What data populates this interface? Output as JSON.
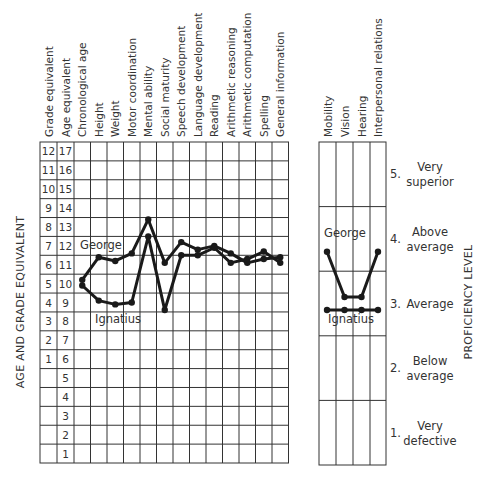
{
  "chart_data": [
    {
      "type": "line",
      "title": "",
      "ylabel": "AGE AND GRADE EQUIVALENT",
      "categories": [
        "Chronological age",
        "Height",
        "Weight",
        "Motor coordination",
        "Mental ability",
        "Social maturity",
        "Speech development",
        "Language development",
        "Reading",
        "Arithmetic reasoning",
        "Arithmetic computation",
        "Spelling",
        "General information"
      ],
      "y_scales": {
        "grade_equivalent": [
          "12",
          "11",
          "10",
          "9",
          "8",
          "7",
          "6",
          "5",
          "4",
          "3",
          "2",
          "1",
          "",
          "",
          "",
          "",
          ""
        ],
        "age_equivalent": [
          "17",
          "16",
          "15",
          "14",
          "13",
          "12",
          "11",
          "10",
          "9",
          "8",
          "7",
          "6",
          "5",
          "4",
          "3",
          "2",
          "1"
        ]
      },
      "ylim_age": [
        0,
        17
      ],
      "series": [
        {
          "name": "George",
          "values": [
            10.2,
            11.4,
            11.2,
            11.6,
            13.4,
            11.1,
            12.2,
            11.8,
            12.0,
            11.6,
            11.1,
            11.3,
            11.4
          ]
        },
        {
          "name": "Ignatius",
          "values": [
            9.9,
            9.1,
            8.9,
            9.0,
            12.5,
            8.6,
            11.5,
            11.5,
            11.9,
            11.1,
            11.3,
            11.7,
            11.1
          ]
        }
      ],
      "annotations": [
        "George",
        "Ignatius"
      ],
      "grid": true
    },
    {
      "type": "line",
      "title": "",
      "ylabel": "PROFICIENCY LEVEL",
      "categories": [
        "Mobility",
        "Vision",
        "Hearing",
        "Interpersonal relations"
      ],
      "levels": [
        {
          "num": "5.",
          "line1": "Very",
          "line2": "superior"
        },
        {
          "num": "4.",
          "line1": "Above",
          "line2": "average"
        },
        {
          "num": "3.",
          "line1": "Average",
          "line2": ""
        },
        {
          "num": "2.",
          "line1": "Below",
          "line2": "average"
        },
        {
          "num": "1.",
          "line1": "Very",
          "line2": "defective"
        }
      ],
      "ylim": [
        0.5,
        5.5
      ],
      "series": [
        {
          "name": "George",
          "values": [
            3.8,
            3.1,
            3.1,
            3.8
          ]
        },
        {
          "name": "Ignatius",
          "values": [
            2.9,
            2.9,
            2.9,
            2.9
          ]
        }
      ],
      "annotations": [
        "George",
        "Ignatius"
      ],
      "grid": true
    }
  ],
  "left": {
    "headers": [
      "Grade equivalent",
      "Age equivalent",
      "Chronological age",
      "Height",
      "Weight",
      "Motor coordination",
      "Mental ability",
      "Social maturity",
      "Speech development",
      "Language development",
      "Reading",
      "Arithmetic reasoning",
      "Arithmetic computation",
      "Spelling",
      "General information"
    ],
    "axis_label": "AGE AND GRADE EQUIVALENT",
    "george_label": "George",
    "ignatius_label": "Ignatius"
  },
  "right": {
    "headers": [
      "Mobility",
      "Vision",
      "Hearing",
      "Interpersonal relations"
    ],
    "axis_label": "PROFICIENCY LEVEL",
    "george_label": "George",
    "ignatius_label": "Ignatius"
  }
}
